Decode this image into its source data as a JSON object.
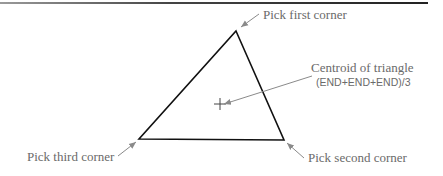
{
  "figure": {
    "labels": {
      "first_corner": "Pick first corner",
      "second_corner": "Pick second corner",
      "third_corner": "Pick third corner",
      "centroid_title": "Centroid of triangle",
      "centroid_formula": "(END+END+END)/3"
    },
    "colors": {
      "triangle_stroke": "#111111",
      "leader_stroke": "#8a8a8a",
      "label_text": "#6a6a6a"
    },
    "triangle": {
      "first_corner": [
        236,
        31
      ],
      "second_corner": [
        284,
        140
      ],
      "third_corner": [
        139,
        139
      ]
    },
    "centroid_marker": [
      220,
      104
    ]
  }
}
